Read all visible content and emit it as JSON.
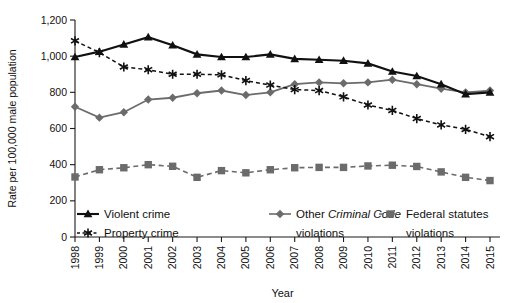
{
  "chart_data": {
    "type": "line",
    "title": "",
    "xlabel": "Year",
    "ylabel": "Rate per 100,000 male population",
    "categories": [
      "1998",
      "1999",
      "2000",
      "2001",
      "2002",
      "2003",
      "2004",
      "2005",
      "2006",
      "2007",
      "2008",
      "2009",
      "2010",
      "2011",
      "2012",
      "2013",
      "2014",
      "2015"
    ],
    "x": [
      1998,
      1999,
      2000,
      2001,
      2002,
      2003,
      2004,
      2005,
      2006,
      2007,
      2008,
      2009,
      2010,
      2011,
      2012,
      2013,
      2014,
      2015
    ],
    "ylim": [
      0,
      1200
    ],
    "yticks": [
      0,
      200,
      400,
      600,
      800,
      1000,
      1200
    ],
    "ytick_labels": [
      "0",
      "200",
      "400",
      "600",
      "800",
      "1,000",
      "1,200"
    ],
    "grid": false,
    "legend_position": "bottom",
    "series": [
      {
        "name": "Violent crime",
        "marker": "triangle",
        "color": "#111111",
        "line_style": "solid",
        "values": [
          995,
          1025,
          1065,
          1105,
          1060,
          1010,
          995,
          995,
          1010,
          985,
          980,
          975,
          960,
          915,
          890,
          845,
          790,
          800
        ]
      },
      {
        "name": "Property crime",
        "marker": "asterisk",
        "color": "#111111",
        "line_style": "dashed",
        "values": [
          1085,
          1020,
          940,
          925,
          900,
          900,
          897,
          865,
          840,
          815,
          810,
          775,
          730,
          700,
          655,
          620,
          595,
          555
        ]
      },
      {
        "name": "Other Criminal Code violations",
        "marker": "diamond",
        "color": "#6b6b6b",
        "line_style": "solid",
        "legend_pre": "Other ",
        "legend_italic": "Criminal Code",
        "legend_post": "violations",
        "values": [
          720,
          660,
          690,
          760,
          770,
          795,
          810,
          785,
          800,
          845,
          855,
          850,
          855,
          870,
          845,
          820,
          800,
          810
        ]
      },
      {
        "name": "Federal statutes violations",
        "marker": "square",
        "color": "#6b6b6b",
        "line_style": "dashed",
        "legend_pre": "Federal statutes",
        "legend_post": "violations",
        "values": [
          332,
          372,
          383,
          400,
          391,
          330,
          367,
          355,
          372,
          383,
          385,
          385,
          393,
          397,
          390,
          360,
          330,
          312
        ]
      }
    ]
  },
  "legend": {
    "items": [
      {
        "label": "Violent crime",
        "marker": "triangle",
        "style": "solid"
      },
      {
        "label": "Property crime",
        "marker": "asterisk",
        "style": "dashed"
      },
      {
        "label": "Other Criminal Code violations",
        "marker": "diamond",
        "style": "solid"
      },
      {
        "label": "Federal statutes violations",
        "marker": "square",
        "style": "dashed"
      }
    ]
  }
}
